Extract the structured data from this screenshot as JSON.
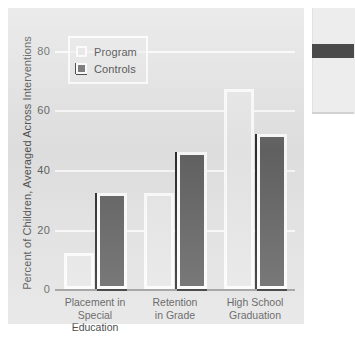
{
  "chart_data": {
    "type": "bar",
    "title": "",
    "subtitle": "",
    "xlabel": "",
    "ylabel": "Percent of Children, Averaged Across Interventions",
    "ylim": [
      0,
      85
    ],
    "yticks": [
      0,
      20,
      40,
      60,
      80
    ],
    "ytick_labels": [
      "0",
      "20",
      "40",
      "60",
      "80"
    ],
    "grid": true,
    "legend_position": "top-left",
    "categories": [
      "Placement in Special Education",
      "Retention in Grade",
      "High School Graduation"
    ],
    "category_lines": [
      [
        "Placement in",
        "Special Education"
      ],
      [
        "Retention",
        "in Grade"
      ],
      [
        "High School",
        "Graduation"
      ]
    ],
    "series": [
      {
        "name": "Program",
        "color": "#e8e8e8",
        "values": [
          12,
          32,
          67
        ]
      },
      {
        "name": "Controls",
        "color": "#636363",
        "values": [
          32,
          46,
          52
        ]
      }
    ]
  },
  "legend": {
    "items": [
      {
        "label": "Program",
        "swatch": "light-square-swatch"
      },
      {
        "label": "Controls",
        "swatch": "dark-square-swatch"
      }
    ]
  },
  "side_panel": {
    "present": true,
    "fragment_label": ""
  }
}
